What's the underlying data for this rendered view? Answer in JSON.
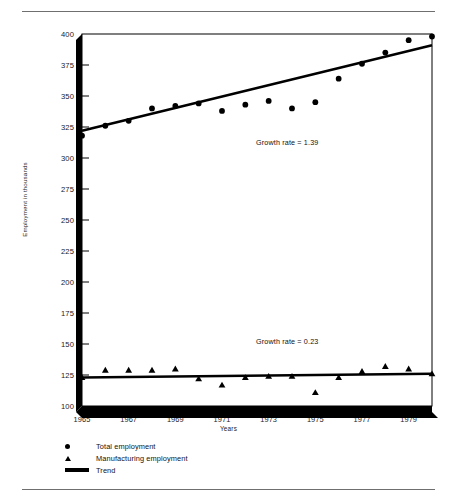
{
  "figure": {
    "top_rule": true,
    "bottom_rule": true
  },
  "chart_data": {
    "type": "scatter",
    "title": "",
    "xlabel": "Years",
    "ylabel": "Employment in thousands",
    "xlim": [
      1965,
      1980
    ],
    "ylim": [
      100,
      400
    ],
    "ytick_values": [
      100,
      125,
      150,
      175,
      200,
      225,
      250,
      275,
      300,
      325,
      350,
      375,
      400
    ],
    "ytick_labels": [
      "100",
      "125",
      "150",
      "175",
      "200",
      "225",
      "250",
      "275",
      "300",
      "325",
      "350",
      "375",
      "400"
    ],
    "xtick_values": [
      1965,
      1967,
      1969,
      1971,
      1973,
      1975,
      1977,
      1979
    ],
    "xtick_labels": [
      "1965",
      "1967",
      "1969",
      "1971",
      "1973",
      "1975",
      "1977",
      "1979"
    ],
    "xtick_minor_values": [
      1966,
      1968,
      1970,
      1972,
      1974,
      1976,
      1978,
      1980
    ],
    "grid": false,
    "legend_position": "below-axes-left",
    "series": [
      {
        "name": "Total employment",
        "marker": "circle",
        "x": [
          1965,
          1966,
          1967,
          1968,
          1969,
          1970,
          1971,
          1972,
          1973,
          1974,
          1975,
          1976,
          1977,
          1978,
          1979,
          1980
        ],
        "values": [
          318,
          326,
          330,
          340,
          342,
          344,
          338,
          343,
          346,
          340,
          345,
          364,
          376,
          385,
          395,
          398
        ]
      },
      {
        "name": "Manufacturing employment",
        "marker": "triangle",
        "x": [
          1965,
          1966,
          1967,
          1968,
          1969,
          1970,
          1971,
          1972,
          1973,
          1974,
          1975,
          1976,
          1977,
          1978,
          1979,
          1980
        ],
        "values": [
          123,
          129,
          129,
          129,
          130,
          122,
          117,
          123,
          124,
          124,
          111,
          123,
          128,
          132,
          130,
          126
        ]
      },
      {
        "name": "Trend",
        "marker": "line",
        "lines": [
          {
            "for": "Total employment",
            "x": [
              1965,
              1980
            ],
            "y": [
              322,
              391
            ]
          },
          {
            "for": "Manufacturing employment",
            "x": [
              1965,
              1980
            ],
            "y": [
              123,
              126
            ]
          }
        ]
      }
    ],
    "annotations": [
      {
        "text": "Growth rate = 1.39",
        "x": 1974.0,
        "y": 312,
        "series": "Total employment"
      },
      {
        "text": "Growth rate = 0.23",
        "x": 1974.0,
        "y": 152,
        "series": "Manufacturing employment"
      }
    ]
  },
  "legend": {
    "entries": [
      {
        "marker": "circle",
        "label": "Total employment"
      },
      {
        "marker": "triangle",
        "label": "Manufacturing employment"
      },
      {
        "marker": "line",
        "label": "Trend"
      }
    ]
  }
}
